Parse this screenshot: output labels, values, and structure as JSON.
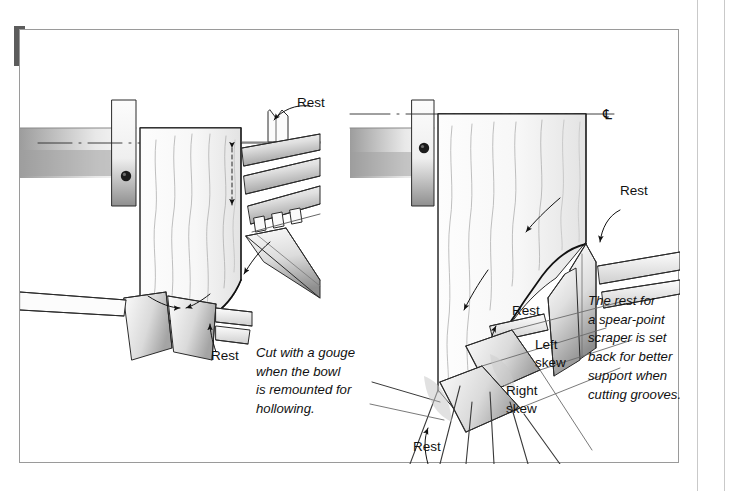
{
  "figure": {
    "title": "SCRAPERS USED FLAT ON PROFILES",
    "accent_color": "#5c5c5c",
    "frame_color": "#9a9a9a",
    "background": "#ffffff",
    "ink_color": "#1a1a1a"
  },
  "left_diagram": {
    "name": "round-nose-scraper-on-bowl-exterior",
    "labels": [
      {
        "id": "rest-top",
        "text": "Rest"
      },
      {
        "id": "rest-bottom",
        "text": "Rest"
      }
    ]
  },
  "right_diagram": {
    "name": "spear-point-and-skew-scrapers-on-bowl-exterior",
    "centerline_symbol": "℄",
    "labels": [
      {
        "id": "rest-top-right",
        "text": "Rest"
      },
      {
        "id": "rest-middle",
        "text": "Rest"
      },
      {
        "id": "left-skew",
        "text": "Left\nskew",
        "line1": "Left",
        "line2": "skew"
      },
      {
        "id": "right-skew",
        "text": "Right\nskew",
        "line1": "Right",
        "line2": "skew"
      },
      {
        "id": "rest-bottom-right",
        "text": "Rest"
      }
    ]
  },
  "captions": [
    {
      "id": "gouge-caption",
      "lines": [
        "Cut with a gouge",
        "when the bowl",
        "is remounted for",
        "hollowing."
      ]
    },
    {
      "id": "spear-point-caption",
      "lines": [
        "The rest for",
        "a spear-point",
        "scraper is set",
        "back for better",
        "support when",
        "cutting grooves."
      ]
    }
  ]
}
